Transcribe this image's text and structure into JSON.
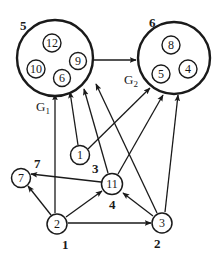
{
  "diagram": {
    "type": "directed-graph",
    "colors": {
      "stroke": "#1a1a1a",
      "background": "#ffffff"
    },
    "groups": [
      {
        "id": "G1",
        "name": "G",
        "subscript": "1",
        "number_label": "5",
        "members": [
          "12",
          "10",
          "9",
          "6"
        ]
      },
      {
        "id": "G2",
        "name": "G",
        "subscript": "2",
        "number_label": "6",
        "members": [
          "8",
          "5",
          "4"
        ]
      }
    ],
    "inner_nodes": {
      "n12": "12",
      "n10": "10",
      "n9": "9",
      "n6": "6",
      "n8": "8",
      "n5": "5",
      "n4": "4"
    },
    "outer_nodes": {
      "n7": {
        "label": "7",
        "number_label": "7"
      },
      "n1": {
        "label": "1",
        "number_label": "3"
      },
      "n11": {
        "label": "11",
        "number_label": "4"
      },
      "n2": {
        "label": "2",
        "number_label": "1"
      },
      "n3": {
        "label": "3",
        "number_label": "2"
      }
    },
    "edges": [
      {
        "from": "G1",
        "to": "G2"
      },
      {
        "from": "2",
        "to": "G1"
      },
      {
        "from": "2",
        "to": "7"
      },
      {
        "from": "2",
        "to": "11"
      },
      {
        "from": "2",
        "to": "3"
      },
      {
        "from": "1",
        "to": "G1"
      },
      {
        "from": "1",
        "to": "G2"
      },
      {
        "from": "11",
        "to": "G1"
      },
      {
        "from": "11",
        "to": "7"
      },
      {
        "from": "11",
        "to": "G2"
      },
      {
        "from": "3",
        "to": "11"
      },
      {
        "from": "3",
        "to": "G1"
      },
      {
        "from": "3",
        "to": "G2"
      }
    ]
  }
}
